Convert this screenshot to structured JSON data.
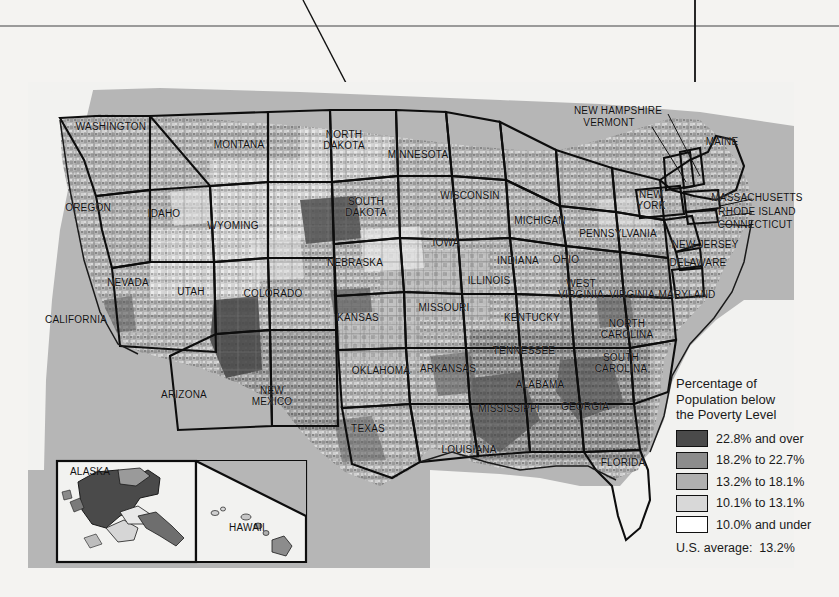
{
  "page": {
    "background_color": "#f4f3f1",
    "rule_color": "#9a9a9a"
  },
  "map": {
    "title_implied": "Percentage of Population below the Poverty Level by County",
    "panel_background": "#b6b6b6",
    "ocean_color": "#ffffff",
    "state_labels": [
      {
        "name": "WASHINGTON",
        "text": "WASHINGTON",
        "x": 111,
        "y": 127
      },
      {
        "name": "OREGON",
        "text": "OREGON",
        "x": 88,
        "y": 208
      },
      {
        "name": "CALIFORNIA",
        "text": "CALIFORNIA",
        "x": 76,
        "y": 320
      },
      {
        "name": "IDAHO",
        "text": "IDAHO",
        "x": 164,
        "y": 214
      },
      {
        "name": "NEVADA",
        "text": "NEVADA",
        "x": 128,
        "y": 283
      },
      {
        "name": "UTAH",
        "text": "UTAH",
        "x": 191,
        "y": 292
      },
      {
        "name": "ARIZONA",
        "text": "ARIZONA",
        "x": 184,
        "y": 395
      },
      {
        "name": "MONTANA",
        "text": "MONTANA",
        "x": 239,
        "y": 145
      },
      {
        "name": "WYOMING",
        "text": "WYOMING",
        "x": 233,
        "y": 226
      },
      {
        "name": "COLORADO",
        "text": "COLORADO",
        "x": 273,
        "y": 294
      },
      {
        "name": "NEW MEXICO",
        "text": "NEW\nMEXICO",
        "x": 272,
        "y": 396
      },
      {
        "name": "NORTH DAKOTA",
        "text": "NORTH\nDAKOTA",
        "x": 344,
        "y": 140
      },
      {
        "name": "SOUTH DAKOTA",
        "text": "SOUTH\nDAKOTA",
        "x": 366,
        "y": 207
      },
      {
        "name": "NEBRASKA",
        "text": "NEBRASKA",
        "x": 355,
        "y": 263
      },
      {
        "name": "KANSAS",
        "text": "KANSAS",
        "x": 358,
        "y": 318
      },
      {
        "name": "OKLAHOMA",
        "text": "OKLAHOMA",
        "x": 381,
        "y": 371
      },
      {
        "name": "TEXAS",
        "text": "TEXAS",
        "x": 368,
        "y": 429
      },
      {
        "name": "MINNESOTA",
        "text": "MINNESOTA",
        "x": 418,
        "y": 155
      },
      {
        "name": "IOWA",
        "text": "IOWA",
        "x": 446,
        "y": 243
      },
      {
        "name": "MISSOURI",
        "text": "MISSOURI",
        "x": 444,
        "y": 308
      },
      {
        "name": "ARKANSAS",
        "text": "ARKANSAS",
        "x": 448,
        "y": 369
      },
      {
        "name": "LOUISIANA",
        "text": "LOUISIANA",
        "x": 469,
        "y": 450
      },
      {
        "name": "WISCONSIN",
        "text": "WISCONSIN",
        "x": 470,
        "y": 196
      },
      {
        "name": "ILLINOIS",
        "text": "ILLINOIS",
        "x": 489,
        "y": 281
      },
      {
        "name": "MICHIGAN",
        "text": "MICHIGAN",
        "x": 540,
        "y": 221
      },
      {
        "name": "INDIANA",
        "text": "INDIANA",
        "x": 518,
        "y": 261
      },
      {
        "name": "OHIO",
        "text": "OHIO",
        "x": 566,
        "y": 260
      },
      {
        "name": "KENTUCKY",
        "text": "KENTUCKY",
        "x": 532,
        "y": 318
      },
      {
        "name": "TENNESSEE",
        "text": "TENNESSEE",
        "x": 524,
        "y": 351
      },
      {
        "name": "MISSISSIPPI",
        "text": "MISSISSIPPI",
        "x": 509,
        "y": 409
      },
      {
        "name": "ALABAMA",
        "text": "ALABAMA",
        "x": 540,
        "y": 385
      },
      {
        "name": "GEORGIA",
        "text": "GEORGIA",
        "x": 585,
        "y": 407
      },
      {
        "name": "FLORIDA",
        "text": "FLORIDA",
        "x": 623,
        "y": 463
      },
      {
        "name": "SOUTH CAROLINA",
        "text": "SOUTH\nCAROLINA",
        "x": 621,
        "y": 363
      },
      {
        "name": "NORTH CAROLINA",
        "text": "NORTH\nCAROLINA",
        "x": 627,
        "y": 329
      },
      {
        "name": "WEST VIRGINIA",
        "text": "WEST\nVIRGINIA",
        "x": 581,
        "y": 289
      },
      {
        "name": "VIRGINIA",
        "text": "VIRGINIA",
        "x": 632,
        "y": 295
      },
      {
        "name": "MARYLAND",
        "text": "MARYLAND",
        "x": 687,
        "y": 295
      },
      {
        "name": "DELAWARE",
        "text": "DELAWARE",
        "x": 698,
        "y": 263
      },
      {
        "name": "NEW JERSEY",
        "text": "NEW JERSEY",
        "x": 705,
        "y": 245
      },
      {
        "name": "PENNSYLVANIA",
        "text": "PENNSYLVANIA",
        "x": 618,
        "y": 234
      },
      {
        "name": "NEW YORK",
        "text": "NEW\nYORK",
        "x": 651,
        "y": 200
      },
      {
        "name": "CONNECTICUT",
        "text": "CONNECTICUT",
        "x": 755,
        "y": 225
      },
      {
        "name": "RHODE ISLAND",
        "text": "RHODE ISLAND",
        "x": 757,
        "y": 212
      },
      {
        "name": "MASSACHUSETTS",
        "text": "MASSACHUSETTS",
        "x": 757,
        "y": 198
      },
      {
        "name": "MAINE",
        "text": "MAINE",
        "x": 722,
        "y": 142
      },
      {
        "name": "VERMONT",
        "text": "VERMONT",
        "x": 609,
        "y": 123
      },
      {
        "name": "NEW HAMPSHIRE",
        "text": "NEW HAMPSHIRE",
        "x": 618,
        "y": 111
      }
    ],
    "inset_labels": [
      {
        "name": "ALASKA",
        "text": "ALASKA",
        "x": 70,
        "y": 472
      },
      {
        "name": "HAWAII",
        "text": "HAWAII",
        "x": 229,
        "y": 528
      }
    ]
  },
  "legend": {
    "title": "Percentage of\nPopulation below\nthe Poverty Level",
    "classes": [
      {
        "label": "22.8% and over",
        "color": "#4a4a4a"
      },
      {
        "label": "18.2% to 22.7%",
        "color": "#8c8c8c"
      },
      {
        "label": "13.2% to 18.1%",
        "color": "#b0b0b0"
      },
      {
        "label": "10.1% to 13.1%",
        "color": "#d8d8d8"
      },
      {
        "label": "10.0% and under",
        "color": "#ffffff"
      }
    ],
    "average": "U.S. average:  13.2%"
  }
}
